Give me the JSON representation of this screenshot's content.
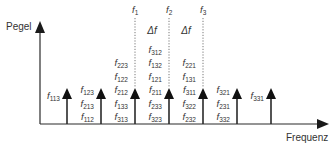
{
  "axes": {
    "y_label": "Pegel",
    "x_label": "Frequenz"
  },
  "fundamentals": [
    {
      "name": "f",
      "sub": "1",
      "x": 135
    },
    {
      "name": "f",
      "sub": "2",
      "x": 169
    },
    {
      "name": "f",
      "sub": "3",
      "x": 203
    }
  ],
  "spacing_labels": [
    {
      "text": "Δf",
      "x": 152
    },
    {
      "text": "Δf",
      "x": 186
    }
  ],
  "spectral_lines": [
    {
      "x": 67,
      "labels": [
        "113"
      ],
      "label_side": "left"
    },
    {
      "x": 101,
      "labels": [
        "123",
        "213",
        "112"
      ],
      "label_side": "left"
    },
    {
      "x": 135,
      "labels": [
        "223",
        "122",
        "212",
        "133",
        "313"
      ],
      "label_side": "left"
    },
    {
      "x": 169,
      "labels": [
        "312",
        "132",
        "121",
        "211",
        "233",
        "323"
      ],
      "label_side": "left"
    },
    {
      "x": 203,
      "labels": [
        "221",
        "131",
        "311",
        "322",
        "232"
      ],
      "label_side": "left"
    },
    {
      "x": 237,
      "labels": [
        "321",
        "231",
        "332"
      ],
      "label_side": "left"
    },
    {
      "x": 271,
      "labels": [
        "331"
      ],
      "label_side": "left"
    }
  ],
  "colors": {
    "line": "#2a2a2a",
    "dotted": "#555555",
    "text": "#333333"
  }
}
